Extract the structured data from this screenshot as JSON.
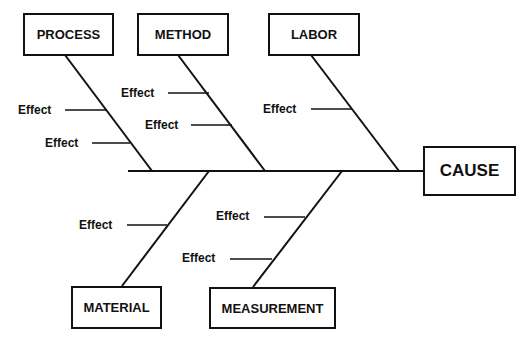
{
  "diagram": {
    "type": "fishbone",
    "head": {
      "label": "CAUSE"
    },
    "categories": [
      {
        "label": "PROCESS",
        "effects": [
          "Effect",
          "Effect"
        ]
      },
      {
        "label": "METHOD",
        "effects": [
          "Effect",
          "Effect"
        ]
      },
      {
        "label": "LABOR",
        "effects": [
          "Effect"
        ]
      },
      {
        "label": "MATERIAL",
        "effects": [
          "Effect"
        ]
      },
      {
        "label": "MEASUREMENT",
        "effects": [
          "Effect",
          "Effect"
        ]
      }
    ]
  }
}
